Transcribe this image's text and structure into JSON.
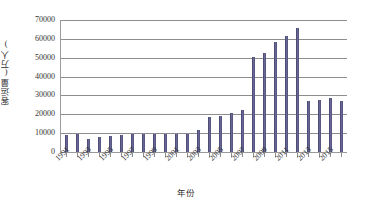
{
  "chart_data": {
    "type": "bar",
    "title": "",
    "xlabel": "年份",
    "ylabel": "客运量(万人)",
    "ylim": [
      0,
      70000
    ],
    "ytick_step": 10000,
    "yticks": [
      "70000",
      "60000",
      "50000",
      "40000",
      "30000",
      "20000",
      "10000",
      "0"
    ],
    "grid": true,
    "legend": "none",
    "bar_color": "#50507c",
    "axis_color": "#8d8d8d",
    "categories": [
      "1991",
      "1992",
      "1993",
      "1994",
      "1995",
      "1996",
      "1997",
      "1998",
      "1999",
      "2000",
      "2001",
      "2002",
      "2003",
      "2004",
      "2005",
      "2006",
      "2007",
      "2008",
      "2009",
      "2010",
      "2011",
      "2012",
      "2013",
      "2014",
      "2015",
      "2016"
    ],
    "visible_xtick_labels": [
      "1991",
      "1993",
      "1995",
      "1997",
      "1999",
      "2001",
      "2003",
      "2005",
      "2007",
      "2009",
      "2011",
      "2013",
      "2015"
    ],
    "values": [
      9000,
      9300,
      6800,
      8000,
      8300,
      9000,
      9700,
      9500,
      9700,
      9800,
      9700,
      9800,
      11800,
      18400,
      19300,
      20500,
      22500,
      50400,
      52500,
      58100,
      61500,
      66000,
      27300,
      27800,
      28900,
      27300
    ]
  }
}
